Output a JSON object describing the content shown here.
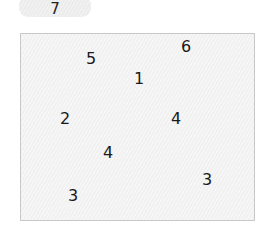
{
  "counter": {
    "value": "7"
  },
  "board": {
    "numbers": [
      {
        "value": "5",
        "x": 90,
        "y": 58
      },
      {
        "value": "6",
        "x": 185,
        "y": 46
      },
      {
        "value": "1",
        "x": 138,
        "y": 78
      },
      {
        "value": "2",
        "x": 64,
        "y": 118
      },
      {
        "value": "4",
        "x": 175,
        "y": 118
      },
      {
        "value": "4",
        "x": 107,
        "y": 152
      },
      {
        "value": "3",
        "x": 206,
        "y": 179
      },
      {
        "value": "3",
        "x": 72,
        "y": 195
      }
    ]
  }
}
